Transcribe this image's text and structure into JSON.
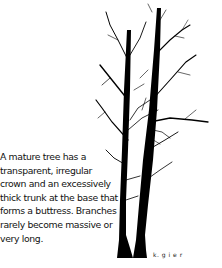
{
  "caption": {
    "lines": [
      "A mature tree has a",
      "transparent, irregular",
      "crown and an excessively",
      "thick trunk at the base that",
      "forms a buttress. Branches",
      "rarely become massive or",
      "very long."
    ]
  },
  "illustration": {
    "subject": "tree-silhouette",
    "signature": "k. g i e r"
  }
}
